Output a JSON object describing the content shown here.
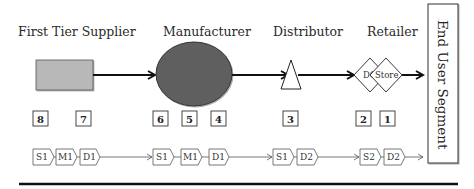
{
  "stages": [
    {
      "label": "First Tier Supplier",
      "shape": "rectangle",
      "color": "#b8b8b8"
    },
    {
      "label": "Manufacturer",
      "shape": "circle",
      "color": "#5e5e5e"
    },
    {
      "label": "Distributor",
      "shape": "triangle",
      "color": "#ffffff"
    },
    {
      "label": "Retailer",
      "shape": "diamonds",
      "color": "#ffffff"
    }
  ],
  "retailer_diamonds": [
    "DC",
    "Store"
  ],
  "end_user": {
    "label": "End User Segment"
  },
  "number_boxes": [
    "8",
    "7",
    "6",
    "5",
    "4",
    "3",
    "2",
    "1"
  ],
  "process_steps": {
    "supplier": [
      "S1",
      "M1",
      "D1"
    ],
    "manufacturer": [
      "S1",
      "M1",
      "D1"
    ],
    "distributor": [
      "S1",
      "D2"
    ],
    "retailer": [
      "S2",
      "D2"
    ]
  },
  "colors": {
    "line": "#111111",
    "box_border": "#333333",
    "rect_fill": "#b8b8b8",
    "circle_fill": "#5e5e5e"
  }
}
